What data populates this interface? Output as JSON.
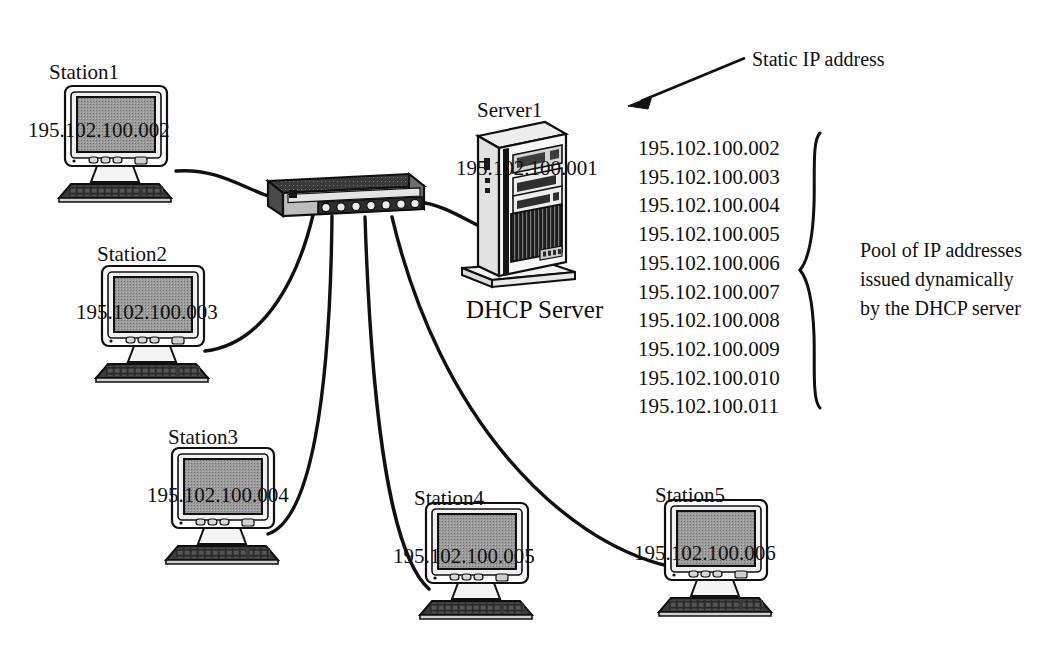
{
  "diagram": {
    "type": "network-topology",
    "background_color": "#ffffff",
    "ink_color": "#101010"
  },
  "stations": [
    {
      "name": "Station1",
      "ip": "195.102.100.002"
    },
    {
      "name": "Station2",
      "ip": "195.102.100.003"
    },
    {
      "name": "Station3",
      "ip": "195.102.100.004"
    },
    {
      "name": "Station4",
      "ip": "195.102.100.005"
    },
    {
      "name": "Station5",
      "ip": "195.102.100.006"
    }
  ],
  "server": {
    "name": "Server1",
    "ip": "195.102.100.001",
    "caption": "DHCP Server"
  },
  "annotations": {
    "static": "Static IP address",
    "pool_line1": "Pool of IP addresses",
    "pool_line2": "issued dynamically",
    "pool_line3": "by the DHCP server"
  },
  "address_pool": [
    "195.102.100.002",
    "195.102.100.003",
    "195.102.100.004",
    "195.102.100.005",
    "195.102.100.006",
    "195.102.100.007",
    "195.102.100.008",
    "195.102.100.009",
    "195.102.100.010",
    "195.102.100.011"
  ],
  "hub": {
    "ports": 7
  }
}
